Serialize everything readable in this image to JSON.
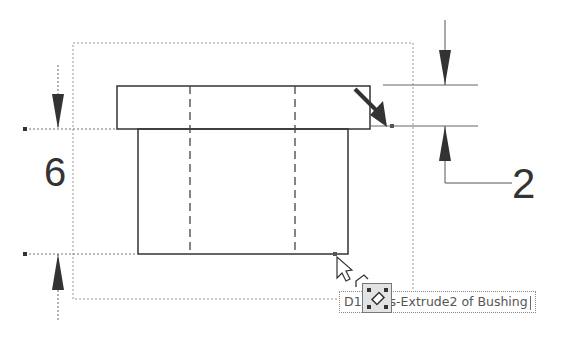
{
  "view": {
    "part_name": "Bushing",
    "feature": "Boss-Extrude2"
  },
  "dimensions": [
    {
      "id": "height",
      "value": "6",
      "orientation": "vertical",
      "position": "left"
    },
    {
      "id": "flange",
      "value": "2",
      "orientation": "vertical",
      "position": "right"
    }
  ],
  "tooltip": {
    "prefix": "D1",
    "suffix": "s-Extrude2 of Bushing"
  },
  "cursor": {
    "type": "pointer-with-dimension-select",
    "icon": "dimension-select-icon"
  },
  "colors": {
    "geometry": "#333333",
    "construction": "#888888",
    "arrow": "#333333",
    "tooltip_bg": "#ffffff"
  }
}
